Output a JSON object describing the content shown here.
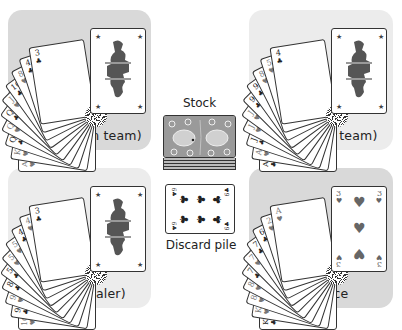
{
  "players": {
    "top_left": {
      "name": "Maria (green team)",
      "panel_color": "#d9d9d9",
      "fan_cards": [
        {
          "rank": "A",
          "suit": "♥"
        },
        {
          "rank": "K",
          "suit": "♥"
        },
        {
          "rank": "Q",
          "suit": "♣"
        },
        {
          "rank": "Q",
          "suit": "♥"
        },
        {
          "rank": "Q",
          "suit": "♣"
        },
        {
          "rank": "J",
          "suit": "♥"
        },
        {
          "rank": "10",
          "suit": "♣"
        },
        {
          "rank": "8",
          "suit": "♥"
        },
        {
          "rank": "4",
          "suit": "♣"
        },
        {
          "rank": "3",
          "suit": "♣"
        }
      ],
      "top_card": "Jack"
    },
    "top_right": {
      "name": "Peter (blue team)",
      "panel_color": "#ececec",
      "fan_cards": [
        {
          "rank": "A",
          "suit": "♣"
        },
        {
          "rank": "A",
          "suit": "♥"
        },
        {
          "rank": "J",
          "suit": "♣"
        },
        {
          "rank": "J",
          "suit": "♥"
        },
        {
          "rank": "J",
          "suit": "♥"
        },
        {
          "rank": "9",
          "suit": "♣"
        },
        {
          "rank": "9",
          "suit": "♣"
        },
        {
          "rank": "8",
          "suit": "♥"
        },
        {
          "rank": "5",
          "suit": "♥"
        },
        {
          "rank": "4",
          "suit": "♣"
        }
      ],
      "top_card": "Jack"
    },
    "bottom_left": {
      "name": "Ginny (dealer)",
      "panel_color": "#ececec",
      "fan_cards": [
        {
          "rank": "10",
          "suit": "♥"
        },
        {
          "rank": "9",
          "suit": "♣"
        },
        {
          "rank": "9",
          "suit": "♥"
        },
        {
          "rank": "8",
          "suit": "♣"
        },
        {
          "rank": "5",
          "suit": "♣"
        },
        {
          "rank": "5",
          "suit": "♥"
        },
        {
          "rank": "5",
          "suit": "♥"
        },
        {
          "rank": "4",
          "suit": "♣"
        },
        {
          "rank": "4",
          "suit": "♥"
        },
        {
          "rank": "3",
          "suit": "♣"
        }
      ],
      "top_card": "Jack"
    },
    "bottom_right": {
      "name": "Florence",
      "panel_color": "#d9d9d9",
      "fan_cards": [
        {
          "rank": "K",
          "suit": "♣"
        },
        {
          "rank": "K",
          "suit": "♥"
        },
        {
          "rank": "8",
          "suit": "♥"
        },
        {
          "rank": "8",
          "suit": "♥"
        },
        {
          "rank": "7",
          "suit": "♣"
        },
        {
          "rank": "7",
          "suit": "♥"
        },
        {
          "rank": "7",
          "suit": "♣"
        },
        {
          "rank": "6",
          "suit": "♣"
        },
        {
          "rank": "2",
          "suit": "♥"
        },
        {
          "rank": "A",
          "suit": "♥"
        }
      ],
      "top_card": {
        "rank": "3",
        "suit": "♥"
      }
    }
  },
  "center": {
    "stock_label": "Stock",
    "discard_label": "Discard pile",
    "discard_card": {
      "rank": "6",
      "suit": "♣"
    }
  },
  "icons": {
    "club": "♣",
    "heart": "♥",
    "star": "★"
  }
}
